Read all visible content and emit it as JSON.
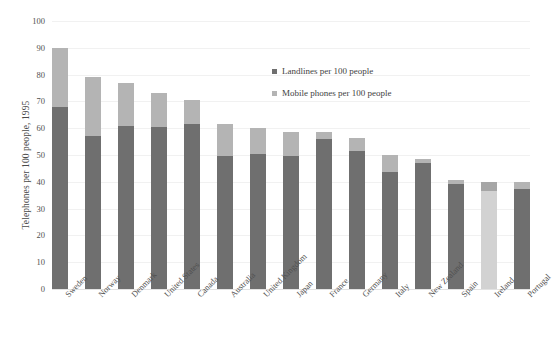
{
  "chart_data": {
    "type": "bar",
    "subtype": "stacked",
    "title": "",
    "xlabel": "",
    "ylabel": "Telephones per 100 people, 1995",
    "ylim": [
      0,
      100
    ],
    "ytick_step": 10,
    "yticks": [
      100,
      90,
      80,
      70,
      60,
      50,
      40,
      30,
      20,
      10,
      0
    ],
    "grid": true,
    "legend_position": "upper right inside",
    "categories": [
      "Sweden",
      "Norway",
      "Denmark",
      "United States",
      "Canada",
      "Australia",
      "United Kingdom",
      "Japan",
      "France",
      "Germany",
      "Italy",
      "New Zealand",
      "Spain",
      "Ireland",
      "Portugal"
    ],
    "series": [
      {
        "name": "Landlines per 100 people",
        "color": "#6f6f6f",
        "values": [
          68,
          57,
          61,
          60.5,
          61.5,
          49.5,
          50.5,
          49.5,
          56,
          51.5,
          43.5,
          47,
          39,
          36.5,
          37.5
        ]
      },
      {
        "name": "Mobile phones per 100 people",
        "color": "#b4b4b4",
        "values": [
          22,
          22,
          16,
          12.5,
          9,
          12,
          9.5,
          9,
          2.5,
          5,
          6.5,
          1.5,
          1.5,
          3.5,
          2.5
        ]
      }
    ],
    "totals": [
      90,
      79,
      77,
      73,
      70.5,
      61.5,
      60,
      58.5,
      58.5,
      56.5,
      50,
      48.5,
      40.5,
      40,
      40
    ],
    "notes": {
      "faded_category": "Ireland"
    }
  },
  "legend": {
    "items": [
      {
        "label": "Landlines per 100 people",
        "swatch": "landline"
      },
      {
        "label": "Mobile phones per 100 people",
        "swatch": "mobile"
      }
    ]
  }
}
